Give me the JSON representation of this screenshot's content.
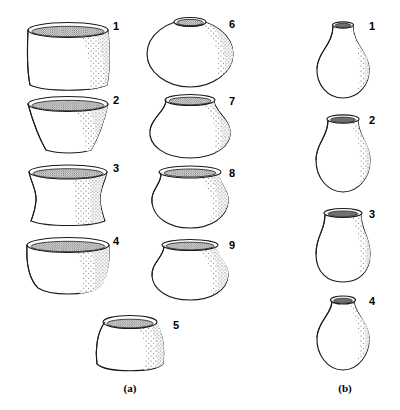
{
  "figure": {
    "background_color": "#ffffff",
    "ink_color": "#1a1a1a",
    "stipple_color": "#555555",
    "panels": [
      {
        "id": "a",
        "label": "(a)",
        "label_x": 130,
        "label_y": 392
      },
      {
        "id": "b",
        "label": "(b)",
        "label_x": 345,
        "label_y": 392
      }
    ],
    "vessels": [
      {
        "number": "1",
        "panel": "a",
        "name": "straight-sided-jar",
        "label_x": 113,
        "label_y": 30,
        "cx": 68,
        "rim_y": 22,
        "base_y": 88,
        "rim_rx": 40,
        "rim_ry": 7,
        "body_half_width": 42
      },
      {
        "number": "2",
        "panel": "a",
        "name": "flaring-conical-bowl",
        "label_x": 113,
        "label_y": 104,
        "cx": 68,
        "rim_y": 98,
        "base_y": 152,
        "rim_rx": 40,
        "rim_ry": 7,
        "body_half_width": 22
      },
      {
        "number": "3",
        "panel": "a",
        "name": "concave-waisted-beaker",
        "label_x": 113,
        "label_y": 172,
        "cx": 68,
        "rim_y": 166,
        "base_y": 222,
        "rim_rx": 40,
        "rim_ry": 7,
        "body_half_width": 32
      },
      {
        "number": "4",
        "panel": "a",
        "name": "round-bottom-bowl",
        "label_x": 113,
        "label_y": 244,
        "cx": 68,
        "rim_y": 238,
        "base_y": 295,
        "rim_rx": 40,
        "rim_ry": 7,
        "body_half_width": 42
      },
      {
        "number": "5",
        "panel": "a",
        "name": "globular-restricted-bowl",
        "label_x": 173,
        "label_y": 326,
        "cx": 130,
        "rim_y": 318,
        "base_y": 375,
        "rim_rx": 27,
        "rim_ry": 6,
        "body_half_width": 35
      },
      {
        "number": "6",
        "panel": "a",
        "name": "wide-globular-jar-small-orifice",
        "label_x": 229,
        "label_y": 28,
        "cx": 190,
        "rim_y": 20,
        "base_y": 86,
        "rim_rx": 14,
        "rim_ry": 4,
        "body_half_width": 43
      },
      {
        "number": "7",
        "panel": "a",
        "name": "short-neck-globular-jar",
        "label_x": 229,
        "label_y": 101,
        "cx": 190,
        "rim_y": 95,
        "base_y": 158,
        "rim_rx": 24,
        "rim_ry": 5,
        "body_half_width": 40
      },
      {
        "number": "8",
        "panel": "a",
        "name": "everted-rim-globular-jar",
        "label_x": 229,
        "label_y": 172,
        "cx": 190,
        "rim_y": 166,
        "base_y": 228,
        "rim_rx": 30,
        "rim_ry": 6,
        "body_half_width": 38
      },
      {
        "number": "9",
        "panel": "a",
        "name": "collared-globular-jar",
        "label_x": 229,
        "label_y": 243,
        "cx": 190,
        "rim_y": 238,
        "base_y": 300,
        "rim_rx": 27,
        "rim_ry": 6,
        "body_half_width": 38
      },
      {
        "number": "1",
        "panel": "b",
        "name": "tall-straight-neck-bottle",
        "label_x": 369,
        "label_y": 30,
        "cx": 343,
        "rim_y": 22,
        "base_y": 98,
        "rim_rx": 10,
        "rim_ry": 3,
        "body_half_width": 26
      },
      {
        "number": "2",
        "panel": "b",
        "name": "flared-neck-bottle",
        "label_x": 369,
        "label_y": 124,
        "cx": 343,
        "rim_y": 116,
        "base_y": 192,
        "rim_rx": 16,
        "rim_ry": 4,
        "body_half_width": 26
      },
      {
        "number": "3",
        "panel": "b",
        "name": "wide-flared-neck-bottle",
        "label_x": 369,
        "label_y": 216,
        "cx": 343,
        "rim_y": 210,
        "base_y": 282,
        "rim_rx": 19,
        "rim_ry": 4,
        "body_half_width": 27
      },
      {
        "number": "4",
        "panel": "b",
        "name": "constricted-neck-bottle",
        "label_x": 369,
        "label_y": 302,
        "cx": 343,
        "rim_y": 296,
        "base_y": 370,
        "rim_rx": 12,
        "rim_ry": 4,
        "body_half_width": 27
      }
    ]
  }
}
